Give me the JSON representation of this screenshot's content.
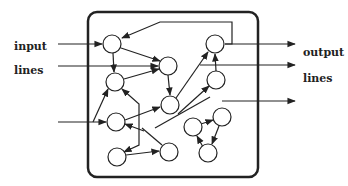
{
  "labels": {
    "input_1": "input",
    "input_2": "lines",
    "output_1": "output",
    "output_2": "lines"
  },
  "colors": {
    "stroke": "#222222",
    "fill": "#ffffff"
  },
  "diagram": {
    "type": "recurrent-network",
    "box": {
      "x": 88,
      "y": 12,
      "w": 170,
      "h": 165,
      "r": 9
    },
    "nodes": [
      {
        "id": "A",
        "x": 112,
        "y": 44
      },
      {
        "id": "B",
        "x": 115,
        "y": 82
      },
      {
        "id": "C",
        "x": 116,
        "y": 122
      },
      {
        "id": "D",
        "x": 117,
        "y": 157
      },
      {
        "id": "E",
        "x": 168,
        "y": 66
      },
      {
        "id": "F",
        "x": 170,
        "y": 105
      },
      {
        "id": "G",
        "x": 169,
        "y": 152
      },
      {
        "id": "H",
        "x": 215,
        "y": 44
      },
      {
        "id": "I",
        "x": 216,
        "y": 80
      },
      {
        "id": "J",
        "x": 193,
        "y": 127
      },
      {
        "id": "K",
        "x": 222,
        "y": 117
      },
      {
        "id": "L",
        "x": 208,
        "y": 153
      }
    ]
  }
}
